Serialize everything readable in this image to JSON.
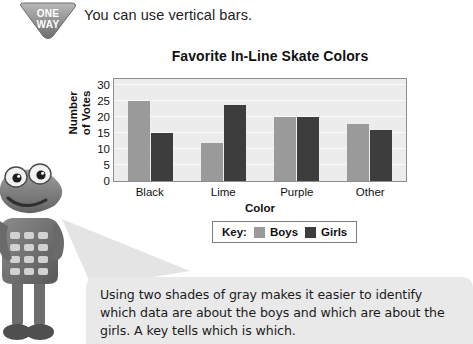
{
  "sign": {
    "line1": "ONE",
    "line2": "WAY",
    "name": "one-way-sign"
  },
  "top_instruction": "You can use vertical bars.",
  "chart_data": {
    "type": "bar",
    "title": "Favorite In-Line Skate Colors",
    "xlabel": "Color",
    "ylabel": "Number of Votes",
    "ylabel_line1": "Number",
    "ylabel_line2": "of Votes",
    "categories": [
      "Black",
      "Lime",
      "Purple",
      "Other"
    ],
    "series": [
      {
        "name": "Boys",
        "values": [
          25,
          12,
          20,
          18
        ],
        "color": "#9a9a9a"
      },
      {
        "name": "Girls",
        "values": [
          15,
          24,
          20,
          16
        ],
        "color": "#3d3d3d"
      }
    ],
    "ylim": [
      0,
      32
    ],
    "yticks": [
      0,
      5,
      10,
      15,
      20,
      25,
      30
    ],
    "grid": true,
    "legend_position": "bottom",
    "legend_title": "Key:",
    "plot_background": "#ececec",
    "gridline_color": "#fbfbfb"
  },
  "caption": "Using two shades of gray makes it easier to identify which data are about the boys and which are about the girls. A key tells which is which."
}
